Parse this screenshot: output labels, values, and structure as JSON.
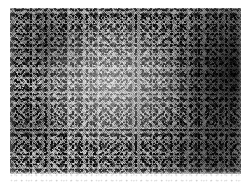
{
  "page": {
    "background_color": "#ffffff",
    "width": 245,
    "height": 184
  },
  "figure": {
    "kind": "grayscale-noise-micrograph",
    "caption": "",
    "plate": {
      "left": 10,
      "top": 8,
      "width": 231,
      "height": 166,
      "base_color": "#8e8e8e",
      "dark_color": "#101010",
      "light_color": "#e8e8e8"
    },
    "tone_regions": [
      {
        "name": "center-highlight",
        "position": "44% 46%",
        "relative_brightness": "light"
      },
      {
        "name": "right-edge-shadow",
        "position": "97% 38%",
        "relative_brightness": "very-dark"
      },
      {
        "name": "lower-right-shadow",
        "position": "88% 86%",
        "relative_brightness": "dark"
      },
      {
        "name": "upper-left-patch",
        "position": "16% 22%",
        "relative_brightness": "dark"
      },
      {
        "name": "left-mid-patch",
        "position": "6% 70%",
        "relative_brightness": "dark"
      }
    ],
    "bottom_residue": {
      "left": 10,
      "bottom": 2,
      "width": 231,
      "height": 9,
      "color": "#8c8c8c"
    }
  }
}
